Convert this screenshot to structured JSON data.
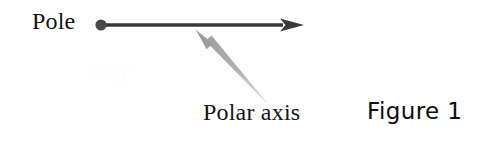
{
  "figure": {
    "background_color": "#fefefe",
    "ink_color": "#3a3a3a",
    "text_color": "#141414",
    "accent_gray": "#a6a6a6",
    "labels": {
      "pole": "Pole",
      "polar_axis": "Polar axis",
      "caption": "Figure 1"
    },
    "icons": {
      "pole_point": "filled-dot",
      "axis_arrow": "right-arrow",
      "pointer_arrow": "diagonal-pointer-arrow"
    },
    "geometry": {
      "pole_dot": {
        "cx": 101,
        "cy": 25,
        "r": 5.6
      },
      "axis_line": {
        "x1": 101,
        "y1": 25,
        "x2": 284,
        "y2": 25,
        "width": 3.4
      },
      "axis_arrowhead": {
        "tip_x": 304,
        "tip_y": 25,
        "base_x": 281,
        "half_height": 6.5
      },
      "pointer_arrow": {
        "tip_x": 196,
        "tip_y": 30,
        "tail_x": 269,
        "tail_y": 104
      }
    },
    "ghost_text": "a ray"
  }
}
